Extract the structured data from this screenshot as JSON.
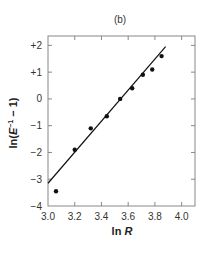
{
  "chart_data": {
    "type": "scatter",
    "title": "(b)",
    "xlabel": "ln R",
    "xlabel_parts": {
      "prefix": "ln ",
      "var": "R"
    },
    "ylabel": "ln(E⁻¹ − 1)",
    "ylabel_parts": {
      "prefix": "ln(",
      "var": "E",
      "sup": "−1",
      "suffix": " − 1)"
    },
    "xlim": [
      3.0,
      4.1
    ],
    "ylim": [
      -4,
      2.35
    ],
    "xticks": [
      3.0,
      3.2,
      3.4,
      3.6,
      3.8,
      4.0
    ],
    "xtick_labels": [
      "3.0",
      "3.2",
      "3.4",
      "3.6",
      "3.8",
      "4.0"
    ],
    "yticks": [
      2,
      1,
      0,
      -1,
      -2,
      -3,
      -4
    ],
    "ytick_labels": [
      "+2",
      "+1",
      "0",
      "−1",
      "−2",
      "−3",
      "−4"
    ],
    "grid": false,
    "legend": null,
    "series": [
      {
        "name": "data",
        "marker": "filled-circle",
        "x": [
          3.06,
          3.2,
          3.32,
          3.44,
          3.54,
          3.63,
          3.71,
          3.78,
          3.85
        ],
        "y": [
          -3.45,
          -1.9,
          -1.1,
          -0.65,
          0.0,
          0.4,
          0.9,
          1.1,
          1.6
        ]
      }
    ],
    "fit_line": {
      "name": "linear fit",
      "x": [
        3.0,
        3.88
      ],
      "y": [
        -3.15,
        1.95
      ]
    }
  },
  "colors": {
    "axis": "#888888",
    "ink": "#111111",
    "text": "#333333"
  }
}
